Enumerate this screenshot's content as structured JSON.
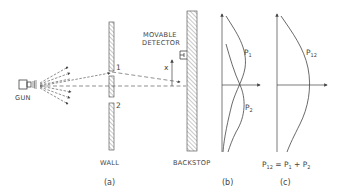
{
  "diagram": {
    "colors": {
      "ink": "#444444",
      "hatch": "#777777",
      "background": "#ffffff"
    },
    "labels": {
      "gun": "GUN",
      "wall": "WALL",
      "backstop": "BACKSTOP",
      "detector_line1": "MOVABLE",
      "detector_line2": "DETECTOR",
      "x_axis": "x",
      "hole1": "1",
      "hole2": "2",
      "p1": "P",
      "p1_sub": "1",
      "p2": "P",
      "p2_sub": "2",
      "p12": "P",
      "p12_sub": "12",
      "formula_lhs": "P",
      "formula_lhs_sub": "12",
      "formula_eq": " = P",
      "formula_mid_sub": "1",
      "formula_plus": " + P",
      "formula_rhs_sub": "2",
      "caption_a": "(a)",
      "caption_b": "(b)",
      "caption_c": "(c)"
    },
    "icons": [
      "gun-icon",
      "detector-icon",
      "arrow-icon",
      "hatched-wall",
      "hatched-backstop"
    ]
  }
}
